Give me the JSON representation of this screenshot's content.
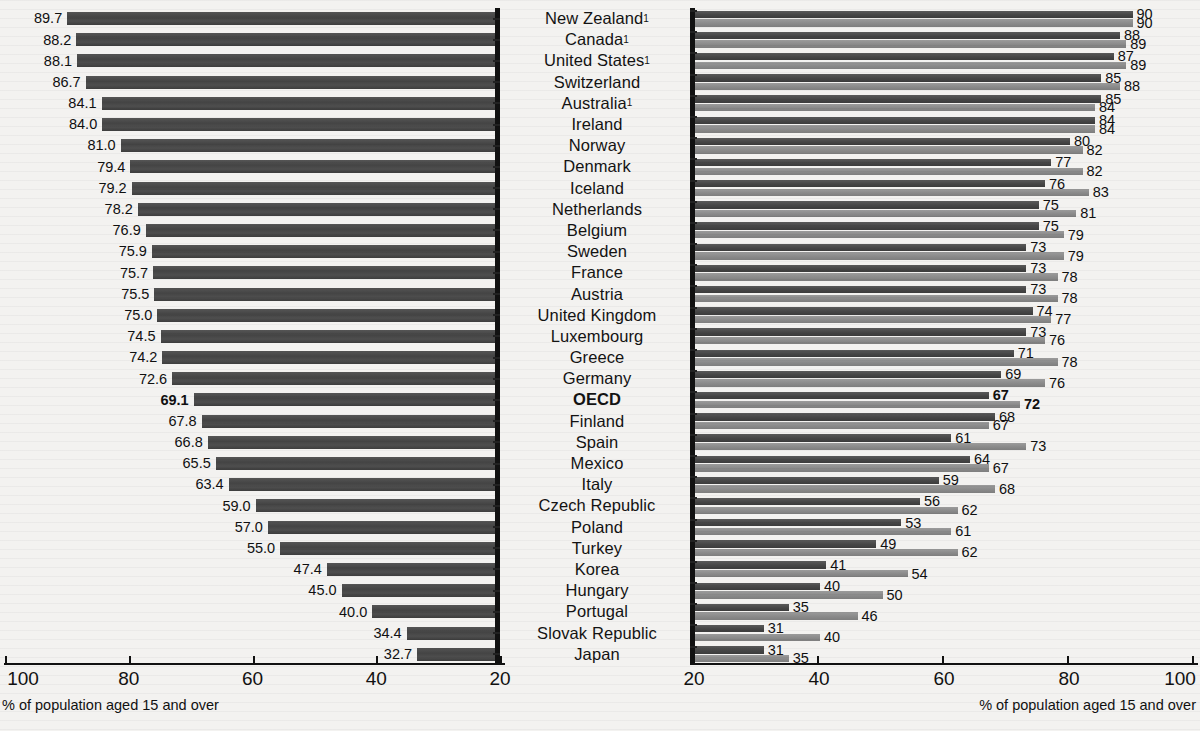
{
  "chart_data": {
    "type": "bar",
    "title": "",
    "subtitle": "",
    "orientation": "horizontal",
    "layout": "back-to-back paired panels sharing centered category labels",
    "categories": [
      "New Zealand¹",
      "Canada¹",
      "United States¹",
      "Switzerland",
      "Australia¹",
      "Ireland",
      "Norway",
      "Denmark",
      "Iceland",
      "Netherlands",
      "Belgium",
      "Sweden",
      "France",
      "Austria",
      "United Kingdom",
      "Luxembourg",
      "Greece",
      "Germany",
      "OECD",
      "Finland",
      "Spain",
      "Mexico",
      "Italy",
      "Czech Republic",
      "Poland",
      "Turkey",
      "Korea",
      "Hungary",
      "Portugal",
      "Slovak Republic",
      "Japan"
    ],
    "highlight_category": "OECD",
    "left_panel": {
      "xlabel": "% of population aged 15 and over",
      "ticks": [
        100,
        80,
        60,
        40,
        20
      ],
      "xlim": [
        100,
        20
      ],
      "direction": "right-to-left (values decrease toward the right)",
      "grid": false,
      "series": [
        {
          "name": "left-series",
          "color": "#474747",
          "values": [
            89.7,
            88.2,
            88.1,
            86.7,
            84.1,
            84.0,
            81.0,
            79.4,
            79.2,
            78.2,
            76.9,
            75.9,
            75.7,
            75.5,
            75.0,
            74.5,
            74.2,
            72.6,
            69.1,
            67.8,
            66.8,
            65.5,
            63.4,
            59.0,
            57.0,
            55.0,
            47.4,
            45.0,
            40.0,
            34.4,
            32.7
          ],
          "labels": [
            "89.7",
            "88.2",
            "88.1",
            "86.7",
            "84.1",
            "84.0",
            "81.0",
            "79.4",
            "79.2",
            "78.2",
            "76.9",
            "75.9",
            "75.7",
            "75.5",
            "75.0",
            "74.5",
            "74.2",
            "72.6",
            "69.1",
            "67.8",
            "66.8",
            "65.5",
            "63.4",
            "59.0",
            "57.0",
            "55.0",
            "47.4",
            "45.0",
            "40.0",
            "34.4",
            "32.7"
          ]
        }
      ]
    },
    "right_panel": {
      "xlabel": "% of population aged 15 and over",
      "ticks": [
        20,
        40,
        60,
        80,
        100
      ],
      "xlim": [
        20,
        100
      ],
      "direction": "left-to-right",
      "grid": false,
      "series": [
        {
          "name": "right-series-dark",
          "color": "#464646",
          "values": [
            90,
            88,
            87,
            85,
            85,
            84,
            80,
            77,
            76,
            75,
            75,
            73,
            73,
            73,
            74,
            73,
            71,
            69,
            67,
            68,
            61,
            64,
            59,
            56,
            53,
            49,
            41,
            40,
            35,
            31,
            31
          ],
          "labels": [
            "90",
            "88",
            "87",
            "85",
            "85",
            "84",
            "80",
            "77",
            "76",
            "75",
            "75",
            "73",
            "73",
            "73",
            "74",
            "73",
            "71",
            "69",
            "67",
            "68",
            "61",
            "64",
            "59",
            "56",
            "53",
            "49",
            "41",
            "40",
            "35",
            "31",
            "31"
          ]
        },
        {
          "name": "right-series-light",
          "color": "#8a8a8a",
          "values": [
            90,
            89,
            89,
            88,
            84,
            84,
            82,
            82,
            83,
            81,
            79,
            79,
            78,
            78,
            77,
            76,
            78,
            76,
            72,
            67,
            73,
            67,
            68,
            62,
            61,
            62,
            54,
            50,
            46,
            40,
            35
          ],
          "labels": [
            "90",
            "89",
            "89",
            "88",
            "84",
            "84",
            "82",
            "82",
            "83",
            "81",
            "79",
            "79",
            "78",
            "78",
            "77",
            "76",
            "78",
            "76",
            "72",
            "67",
            "73",
            "67",
            "68",
            "62",
            "61",
            "62",
            "54",
            "50",
            "46",
            "40",
            "35"
          ]
        }
      ]
    }
  },
  "left": {
    "axis_caption": "% of population aged 15 and over",
    "axis_labels": [
      "100",
      "80",
      "60",
      "40",
      "20"
    ]
  },
  "right": {
    "axis_caption": "% of population aged 15 and over",
    "axis_labels": [
      "20",
      "40",
      "60",
      "80",
      "100"
    ]
  }
}
